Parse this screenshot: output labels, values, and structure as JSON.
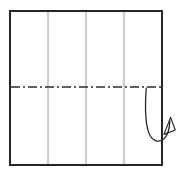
{
  "figure": {
    "title": "Paper folding diagram",
    "type": "origami-fold-instruction",
    "canvas": {
      "width": 187,
      "height": 179,
      "background": "#ffffff"
    },
    "sheet": {
      "label": "square-sheet",
      "x": 10,
      "y": 11,
      "width": 152,
      "height": 154,
      "fill": "#ffffff",
      "stroke": "#262626",
      "stroke_width": 2.2
    },
    "vertical_crease_lines": {
      "label": "vertical-crease-lines",
      "count": 3,
      "x_positions": [
        48,
        86,
        124
      ],
      "y_top": 12,
      "y_bottom": 164,
      "stroke": "#9a9a9a",
      "stroke_width": 1
    },
    "fold_line": {
      "label": "horizontal-dash-dot-fold-line",
      "y": 87,
      "x_start": 11,
      "x_end": 161,
      "stroke": "#2b2b2b",
      "stroke_width": 1.4,
      "dash_pattern": "9 3 2 3",
      "style": "dash-dot"
    },
    "fold_arrow": {
      "label": "curved-fold-arrow",
      "stroke": "#262626",
      "stroke_width": 1.3,
      "path": "M146.2,88.2 C145.2,103 144.6,120 148.4,131.6 C151.6,141.4 159.0,143.6 164.4,138.4 C168.2,134.7 169.6,128.4 169.8,120.6",
      "arrowhead": {
        "label": "open-arrowhead",
        "path": "M164.0,134.4 L170.6,117.4 L175.2,130.0 Z",
        "fill": "none",
        "stroke": "#262626",
        "stroke_width": 1.2,
        "direction": "up-right"
      }
    }
  }
}
